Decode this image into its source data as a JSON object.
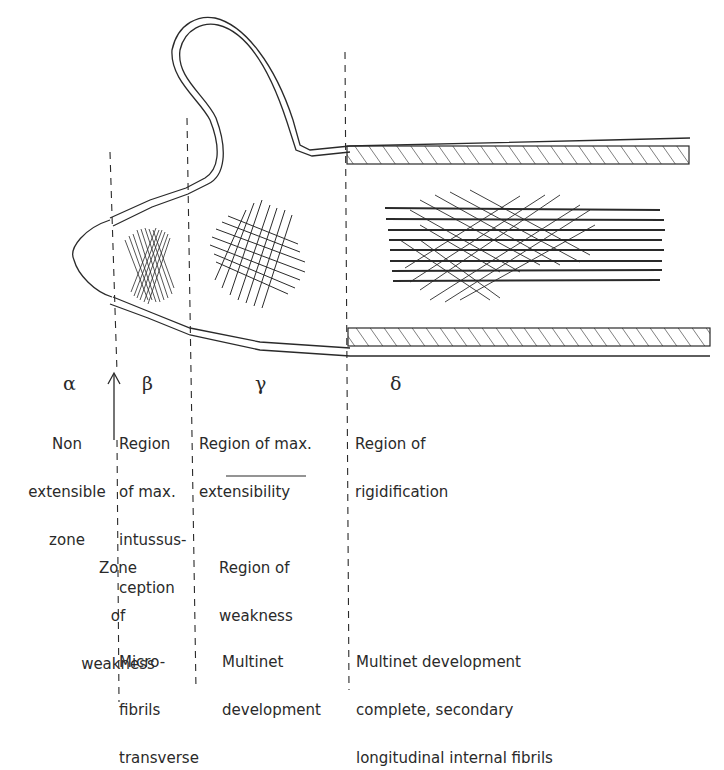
{
  "figure": {
    "colors": {
      "ink": "#2a2a2a",
      "background": "#ffffff"
    }
  },
  "zones": [
    {
      "symbol": "α",
      "name": "Non extensible zone",
      "lines": [
        "Non",
        "extensible",
        "zone"
      ]
    },
    {
      "symbol": "β",
      "name": "Region of max. intussusception",
      "lines": [
        "Region",
        "of max.",
        "intussus-",
        "ception"
      ]
    },
    {
      "symbol": "γ",
      "name": "Region of max. extensibility",
      "lines": [
        "Region of max.",
        "extensibility"
      ]
    },
    {
      "symbol": "δ",
      "name": "Region of rigidification",
      "lines": [
        "Region of",
        "rigidification"
      ]
    }
  ],
  "weakness": {
    "zone": {
      "lines": [
        "Zone",
        "of",
        "weakness"
      ]
    },
    "region": {
      "lines": [
        "Region of",
        "weakness"
      ]
    }
  },
  "fibrils": {
    "beta": {
      "lines": [
        "Micro-",
        "fibrils",
        "transverse"
      ]
    },
    "gamma": {
      "lines": [
        "Multinet",
        "development"
      ]
    },
    "delta": {
      "lines": [
        "Multinet development",
        "complete, secondary",
        "longitudinal internal fibrils"
      ]
    }
  },
  "markers": {
    "arrow": "up-arrow",
    "divider": "horizontal-rule"
  }
}
